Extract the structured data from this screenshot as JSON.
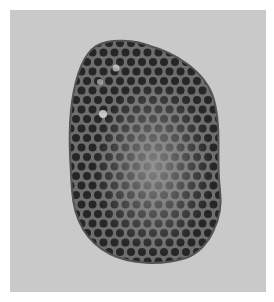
{
  "image": {
    "subject": "wasp nest comb",
    "background_color": "#c8c8c8",
    "border_color": "#ffffff",
    "comb_dark": "#2a2a2a",
    "comb_wall": "#7a7a7a",
    "comb_light_patch": "#9a9a9a"
  }
}
